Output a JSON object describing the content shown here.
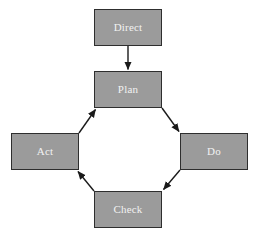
{
  "diagram": {
    "type": "cycle-flow-diagram",
    "background_color": "#ffffff",
    "node_fill_color": "#9b9b9b",
    "node_border_color": "#2e2e2e",
    "node_text_color": "#f2f2f2",
    "connector_color": "#1a1a1a",
    "nodes": [
      {
        "id": "direct",
        "label": "Direct"
      },
      {
        "id": "plan",
        "label": "Plan"
      },
      {
        "id": "do",
        "label": "Do"
      },
      {
        "id": "check",
        "label": "Check"
      },
      {
        "id": "act",
        "label": "Act"
      }
    ],
    "connectors": [
      {
        "id": "direct-to-plan",
        "from": "Direct",
        "to": "Plan",
        "direction": "down"
      },
      {
        "id": "plan-to-do",
        "from": "Plan",
        "to": "Do",
        "direction": "down-right"
      },
      {
        "id": "do-to-check",
        "from": "Do",
        "to": "Check",
        "direction": "down-left"
      },
      {
        "id": "check-to-act",
        "from": "Check",
        "to": "Act",
        "direction": "up-left"
      },
      {
        "id": "act-to-plan",
        "from": "Act",
        "to": "Plan",
        "direction": "up-right"
      }
    ]
  }
}
